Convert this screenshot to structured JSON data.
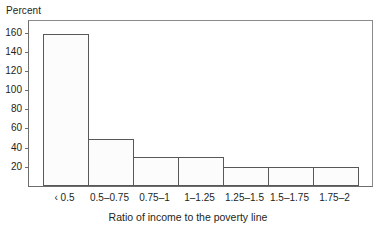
{
  "chart_data": {
    "type": "bar",
    "title": "",
    "subtitle": "",
    "xlabel": "Ratio of income to the poverty line",
    "ylabel": "Percent",
    "categories": [
      "‹ 0.5",
      "0.5–0.75",
      "0.75–1",
      "1–1.25",
      "1.25–1.5",
      "1.5–1.75",
      "1.75–2"
    ],
    "values": [
      158,
      49,
      30,
      30,
      20,
      20,
      20
    ],
    "ylim": [
      0,
      172
    ],
    "yticks": [
      20,
      40,
      60,
      80,
      100,
      120,
      140,
      160
    ],
    "ytick_labels": [
      "20",
      "40",
      "60",
      "80",
      "100",
      "120",
      "140",
      "160"
    ],
    "grid": false,
    "legend": null,
    "legend_position": "none",
    "bar_fill": "#fcfcfc",
    "bar_edge": "#58585a",
    "axis_color": "#6d6d6d",
    "text_color": "#231f20",
    "background": "#ffffff",
    "bars_adjacent": true
  }
}
